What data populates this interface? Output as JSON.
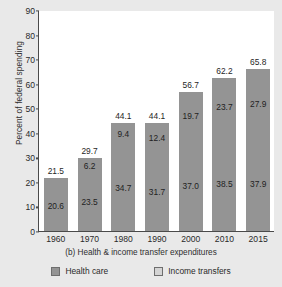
{
  "chart_data": {
    "type": "bar",
    "subtype": "stacked",
    "title": "",
    "caption": "(b) Health & income transfer expenditures",
    "xlabel": "",
    "ylabel": "Percent of federal spending",
    "ylim": [
      0,
      90
    ],
    "ytick_step": 10,
    "yticks": [
      "0",
      "10",
      "20",
      "30",
      "40",
      "50",
      "60",
      "70",
      "80",
      "90"
    ],
    "grid": false,
    "legend_position": "bottom",
    "categories": [
      "1960",
      "1970",
      "1980",
      "1990",
      "2000",
      "2010",
      "2015"
    ],
    "series": [
      {
        "name": "Income transfers",
        "stack_position": "bottom",
        "values": [
          20.6,
          23.5,
          34.7,
          31.7,
          37.0,
          38.5,
          37.9
        ],
        "color": "#949494"
      },
      {
        "name": "Health care",
        "stack_position": "top",
        "values": [
          0.9,
          6.2,
          9.4,
          12.4,
          19.7,
          23.7,
          27.9
        ],
        "color": "#949494"
      }
    ],
    "totals": [
      21.5,
      29.7,
      44.1,
      44.1,
      56.7,
      62.2,
      65.8
    ],
    "bars": [
      {
        "category": "1960",
        "total": "21.5",
        "top": "0.9",
        "bottom": "20.6",
        "total_value": 21.5,
        "top_value": 0.9,
        "bottom_value": 20.6
      },
      {
        "category": "1970",
        "total": "29.7",
        "top": "6.2",
        "bottom": "23.5",
        "total_value": 29.7,
        "top_value": 6.2,
        "bottom_value": 23.5
      },
      {
        "category": "1980",
        "total": "44.1",
        "top": "9.4",
        "bottom": "34.7",
        "total_value": 44.1,
        "top_value": 9.4,
        "bottom_value": 34.7
      },
      {
        "category": "1990",
        "total": "44.1",
        "top": "12.4",
        "bottom": "31.7",
        "total_value": 44.1,
        "top_value": 12.4,
        "bottom_value": 31.7
      },
      {
        "category": "2000",
        "total": "56.7",
        "top": "19.7",
        "bottom": "37.0",
        "total_value": 56.7,
        "top_value": 19.7,
        "bottom_value": 37.0
      },
      {
        "category": "2010",
        "total": "62.2",
        "top": "23.7",
        "bottom": "38.5",
        "total_value": 62.2,
        "top_value": 23.7,
        "bottom_value": 38.5
      },
      {
        "category": "2015",
        "total": "65.8",
        "top": "27.9",
        "bottom": "37.9",
        "total_value": 65.8,
        "top_value": 27.9,
        "bottom_value": 37.9
      }
    ],
    "legend": [
      {
        "label": "Health care",
        "color": "#949494",
        "swatch": "dark-swatch"
      },
      {
        "label": "Income transfers",
        "color": "#d4d4d4",
        "swatch": "light-swatch"
      }
    ],
    "colors": {
      "bar_fill": "#949494",
      "legend_health_care": "#949494",
      "legend_income_transfers": "#d4d4d4",
      "axis": "#4a4a4a",
      "plot_background": "#ffffff",
      "figure_background": "#e9e9e9",
      "text": "#1f1f1f"
    }
  }
}
